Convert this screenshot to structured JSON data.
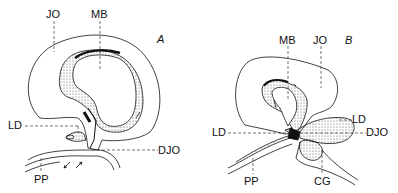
{
  "figure": {
    "panel_a": {
      "letter": "A",
      "labels": {
        "jo": "JO",
        "mb": "MB",
        "ld": "LD",
        "djo": "DJO",
        "pp": "PP"
      }
    },
    "panel_b": {
      "letter": "B",
      "labels": {
        "mb": "MB",
        "jo": "JO",
        "ld_right": "LD",
        "ld_left": "LD",
        "djo": "DJO",
        "pp": "PP",
        "cg": "CG"
      }
    }
  }
}
